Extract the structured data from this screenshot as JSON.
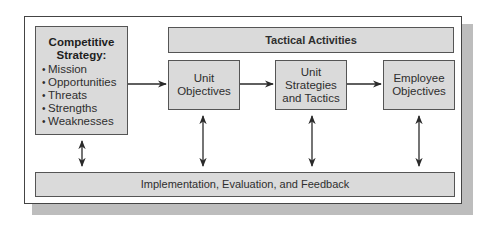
{
  "diagram": {
    "competitive_strategy": {
      "title_line1": "Competitive",
      "title_line2": "Strategy:",
      "bullets": [
        "Mission",
        "Opportunities",
        "Threats",
        "Strengths",
        "Weaknesses"
      ],
      "bullet_glyph": "•"
    },
    "tactical_activities": {
      "label": "Tactical Activities"
    },
    "unit_objectives": {
      "line1": "Unit",
      "line2": "Objectives"
    },
    "unit_strategies": {
      "line1": "Unit",
      "line2": "Strategies",
      "line3": "and Tactics"
    },
    "employee_objectives": {
      "line1": "Employee",
      "line2": "Objectives"
    },
    "implementation": {
      "label": "Implementation, Evaluation, and Feedback"
    },
    "colors": {
      "box_fill": "#dadada",
      "box_border": "#555555",
      "frame_border": "#444444",
      "shadow": "#bdbdbd",
      "arrow": "#2a2a2a"
    }
  }
}
